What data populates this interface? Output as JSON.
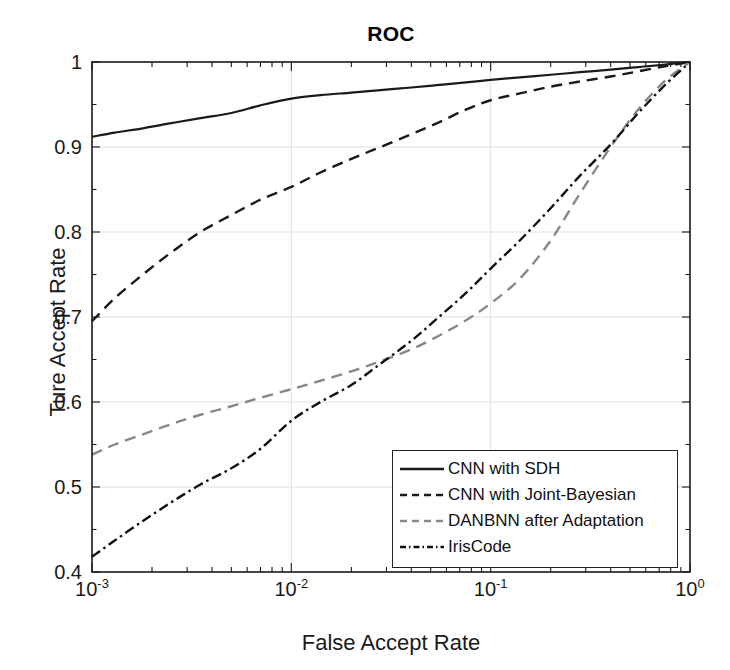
{
  "chart_data": {
    "type": "line",
    "title": "ROC",
    "xlabel": "False Accept Rate",
    "ylabel": "Ture Accept Rate",
    "xscale": "log",
    "yscale": "linear",
    "xlim": [
      0.001,
      1
    ],
    "ylim": [
      0.4,
      1
    ],
    "grid": true,
    "legend_position": "lower right",
    "xticks": [
      {
        "value": 0.001,
        "mantissa": "10",
        "exponent": "-3"
      },
      {
        "value": 0.01,
        "mantissa": "10",
        "exponent": "-2"
      },
      {
        "value": 0.1,
        "mantissa": "10",
        "exponent": "-1"
      },
      {
        "value": 1,
        "mantissa": "10",
        "exponent": "0"
      }
    ],
    "yticks": [
      {
        "value": 0.4,
        "label": "0.4"
      },
      {
        "value": 0.5,
        "label": "0.5"
      },
      {
        "value": 0.6,
        "label": "0.6"
      },
      {
        "value": 0.7,
        "label": "0.7"
      },
      {
        "value": 0.8,
        "label": "0.8"
      },
      {
        "value": 0.9,
        "label": "0.9"
      },
      {
        "value": 1.0,
        "label": "1"
      }
    ],
    "series": [
      {
        "name": "CNN with SDH",
        "style": "solid",
        "color": "#1a1a1a",
        "width": 2.2,
        "x": [
          0.001,
          0.0013,
          0.0018,
          0.0025,
          0.0035,
          0.005,
          0.007,
          0.01,
          0.014,
          0.02,
          0.028,
          0.04,
          0.055,
          0.075,
          0.1,
          0.14,
          0.2,
          0.28,
          0.4,
          0.55,
          0.75,
          1.0
        ],
        "y": [
          0.912,
          0.917,
          0.922,
          0.928,
          0.934,
          0.94,
          0.949,
          0.957,
          0.961,
          0.964,
          0.967,
          0.97,
          0.973,
          0.976,
          0.979,
          0.982,
          0.985,
          0.988,
          0.991,
          0.994,
          0.997,
          1.0
        ]
      },
      {
        "name": "CNN with Joint-Bayesian",
        "style": "dashed",
        "color": "#1a1a1a",
        "width": 2.4,
        "x": [
          0.001,
          0.0013,
          0.0018,
          0.0025,
          0.0035,
          0.005,
          0.007,
          0.01,
          0.014,
          0.02,
          0.028,
          0.04,
          0.055,
          0.075,
          0.1,
          0.14,
          0.2,
          0.28,
          0.4,
          0.55,
          0.75,
          1.0
        ],
        "y": [
          0.695,
          0.722,
          0.75,
          0.776,
          0.8,
          0.82,
          0.838,
          0.853,
          0.87,
          0.886,
          0.9,
          0.915,
          0.929,
          0.944,
          0.955,
          0.963,
          0.971,
          0.977,
          0.983,
          0.989,
          0.995,
          1.0
        ]
      },
      {
        "name": "DANBNN after Adaptation",
        "style": "dashed",
        "color": "#888888",
        "width": 2.4,
        "x": [
          0.001,
          0.0013,
          0.0018,
          0.0025,
          0.0035,
          0.005,
          0.007,
          0.01,
          0.014,
          0.02,
          0.028,
          0.04,
          0.055,
          0.075,
          0.1,
          0.14,
          0.2,
          0.28,
          0.4,
          0.55,
          0.75,
          1.0
        ],
        "y": [
          0.538,
          0.55,
          0.562,
          0.574,
          0.585,
          0.595,
          0.605,
          0.615,
          0.625,
          0.636,
          0.648,
          0.662,
          0.678,
          0.696,
          0.716,
          0.745,
          0.79,
          0.845,
          0.9,
          0.944,
          0.978,
          1.0
        ]
      },
      {
        "name": "IrisCode",
        "style": "dashdot",
        "color": "#111111",
        "width": 2.4,
        "x": [
          0.001,
          0.0013,
          0.0018,
          0.0025,
          0.0035,
          0.005,
          0.007,
          0.01,
          0.014,
          0.02,
          0.028,
          0.04,
          0.055,
          0.075,
          0.1,
          0.14,
          0.2,
          0.28,
          0.4,
          0.55,
          0.75,
          1.0
        ],
        "y": [
          0.418,
          0.437,
          0.46,
          0.482,
          0.503,
          0.522,
          0.545,
          0.578,
          0.6,
          0.62,
          0.645,
          0.672,
          0.7,
          0.728,
          0.757,
          0.79,
          0.828,
          0.866,
          0.903,
          0.94,
          0.973,
          1.0
        ]
      }
    ]
  },
  "legend": {
    "items": [
      {
        "label": "CNN with SDH",
        "style": "solid",
        "color": "#1a1a1a"
      },
      {
        "label": "CNN with Joint-Bayesian",
        "style": "dashed",
        "color": "#1a1a1a"
      },
      {
        "label": "DANBNN after Adaptation",
        "style": "dashed",
        "color": "#888888"
      },
      {
        "label": "IrisCode",
        "style": "dashdot",
        "color": "#111111"
      }
    ]
  },
  "axes": {
    "title": "ROC",
    "x_label": "False Accept Rate",
    "y_label": "Ture Accept Rate"
  }
}
